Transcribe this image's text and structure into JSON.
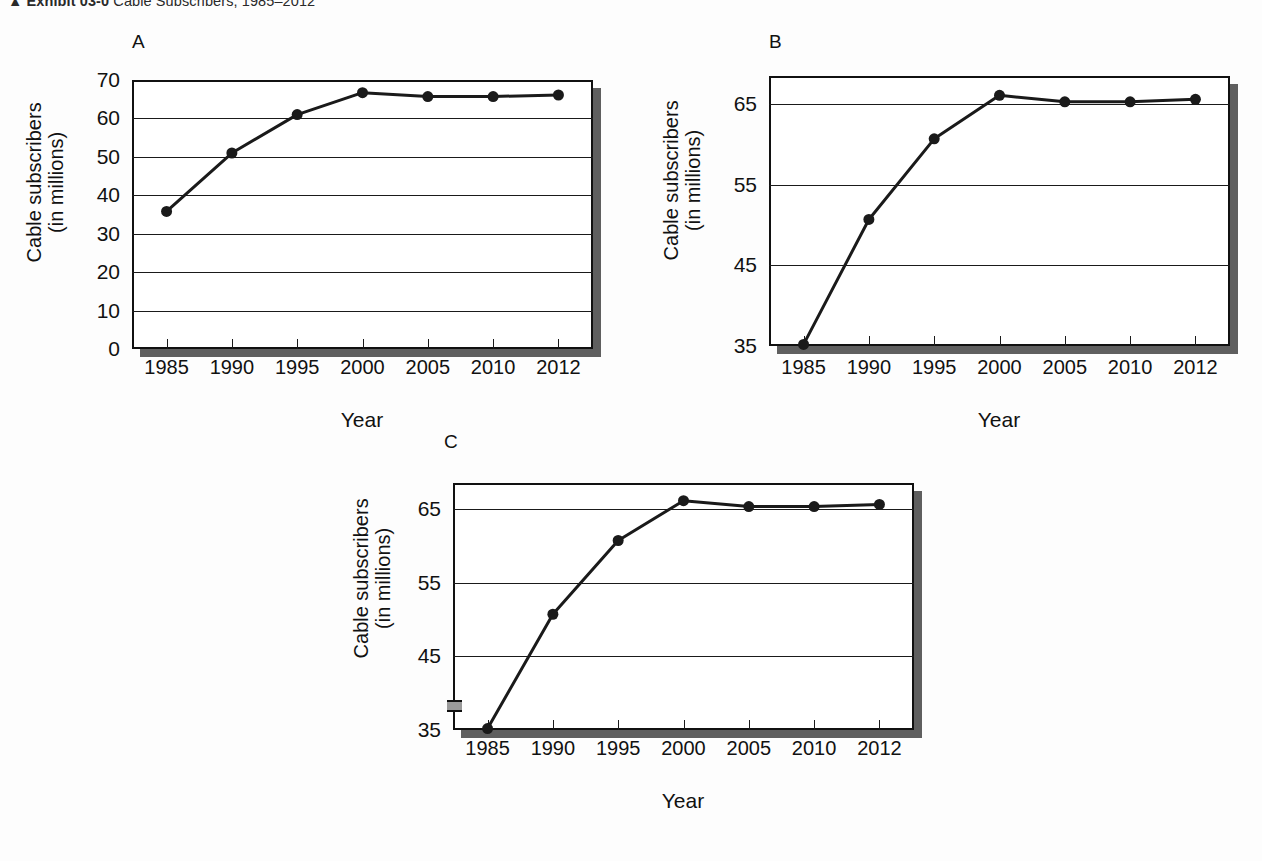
{
  "caption": {
    "prefix": "▲",
    "strong": "Exhibit 03-0",
    "text": "Cable Subscribers, 1985–2012"
  },
  "axis_titles": {
    "x": "Year",
    "y_line1": "Cable subscribers",
    "y_line2": "(in millions)"
  },
  "panels": [
    {
      "letter": "A"
    },
    {
      "letter": "B"
    },
    {
      "letter": "C"
    }
  ],
  "chart_data": [
    {
      "type": "line",
      "title": "A",
      "xlabel": "Year",
      "ylabel": "Cable subscribers (in millions)",
      "categories": [
        "1985",
        "1990",
        "1995",
        "2000",
        "2005",
        "2010",
        "2012"
      ],
      "values": [
        35.8,
        51.0,
        61.0,
        66.7,
        65.7,
        65.7,
        66.1
      ],
      "ylim": [
        0,
        70
      ],
      "yticks": [
        "0",
        "10",
        "20",
        "30",
        "40",
        "50",
        "60",
        "70"
      ],
      "ytick_values": [
        0,
        10,
        20,
        30,
        40,
        50,
        60,
        70
      ],
      "grid": true,
      "legend": "none",
      "axis_break": false,
      "note": "full zero-based y-axis"
    },
    {
      "type": "line",
      "title": "B",
      "xlabel": "Year",
      "ylabel": "Cable subscribers (in millions)",
      "categories": [
        "1985",
        "1990",
        "1995",
        "2000",
        "2005",
        "2010",
        "2012"
      ],
      "values": [
        35.2,
        50.7,
        60.7,
        66.1,
        65.3,
        65.3,
        65.6
      ],
      "ylim": [
        35,
        68.5
      ],
      "yticks": [
        "35",
        "45",
        "55",
        "65"
      ],
      "ytick_values": [
        35,
        45,
        55,
        65
      ],
      "grid": true,
      "legend": "none",
      "axis_break": false,
      "note": "truncated y-axis starting at 35, no break symbol"
    },
    {
      "type": "line",
      "title": "C",
      "xlabel": "Year",
      "ylabel": "Cable subscribers (in millions)",
      "categories": [
        "1985",
        "1990",
        "1995",
        "2000",
        "2005",
        "2010",
        "2012"
      ],
      "values": [
        35.2,
        50.7,
        60.7,
        66.1,
        65.3,
        65.3,
        65.6
      ],
      "ylim": [
        35,
        68.5
      ],
      "yticks": [
        "35",
        "45",
        "55",
        "65"
      ],
      "ytick_values": [
        35,
        45,
        55,
        65
      ],
      "grid": true,
      "legend": "none",
      "axis_break": true,
      "note": "truncated y-axis starting at 35 with axis-break symbol below 35"
    }
  ],
  "colors": {
    "line": "#1a1a1a",
    "marker": "#1a1a1a",
    "frame": "#111111",
    "shadow": "#5f5f5f",
    "background": "#fdfdfd"
  }
}
